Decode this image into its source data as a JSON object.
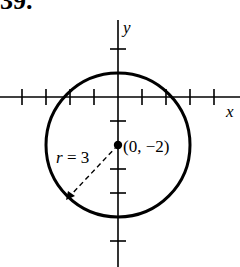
{
  "problem": {
    "number": "39."
  },
  "axes": {
    "x_label": "x",
    "y_label": "y",
    "x_ticks": [
      -4,
      -3,
      -2,
      -1,
      1,
      2,
      3,
      4
    ],
    "y_ticks": [
      2,
      1,
      -1,
      -2,
      -3,
      -4,
      -5
    ]
  },
  "circle": {
    "center_label": "(0, −2)",
    "radius_label": "r = 3",
    "center": [
      0,
      -2
    ],
    "radius": 3,
    "stroke_color": "#000000"
  }
}
